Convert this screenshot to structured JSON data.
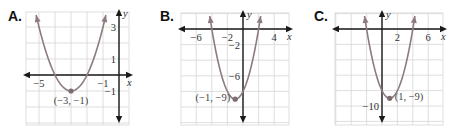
{
  "chart_data": [
    {
      "type": "line",
      "panel": "A.",
      "title": "A.",
      "function": "y = (x + 3)^2 - 1",
      "xlabel": "x",
      "ylabel": "y",
      "x_tick_labels": [
        {
          "value": -5,
          "text": "−5"
        },
        {
          "value": -1,
          "text": "−1"
        }
      ],
      "y_tick_labels": [
        {
          "value": 3,
          "text": "3"
        },
        {
          "value": 1,
          "text": "1"
        },
        {
          "value": -1,
          "text": "−1"
        }
      ],
      "vertex": {
        "x": -3,
        "y": -1,
        "label": "(−3, −1)"
      },
      "x_intercepts": [
        -4,
        -2
      ],
      "xlim": [
        -5.8,
        0.6
      ],
      "ylim": [
        -3.1,
        3.9
      ],
      "grid": true,
      "grid_step": 1,
      "layout": {
        "origin_px": [
          119,
          75
        ],
        "px_per_unit": 16,
        "grid_px": [
          26,
          12,
          129,
          125
        ],
        "letter_px": [
          8,
          21
        ]
      }
    },
    {
      "type": "line",
      "panel": "B.",
      "title": "B.",
      "function": "y = (x + 1)^2 - 9",
      "xlabel": "x",
      "ylabel": "y",
      "x_tick_labels": [
        {
          "value": -6,
          "text": "−6"
        },
        {
          "value": -2,
          "text": "−2"
        },
        {
          "value": 4,
          "text": "4"
        }
      ],
      "y_tick_labels": [
        {
          "value": -2,
          "text": "−2"
        },
        {
          "value": -6,
          "text": "−6"
        }
      ],
      "vertex": {
        "x": -1,
        "y": -9,
        "label": "(−1, −9)"
      },
      "x_intercepts": [
        -4,
        2
      ],
      "xlim": [
        -8,
        6
      ],
      "ylim": [
        -12,
        2
      ],
      "grid": true,
      "grid_step": 2,
      "layout": {
        "origin_px": [
          243,
          29
        ],
        "px_per_unit": 7.8,
        "grid_px": [
          181,
          13,
          289,
          125
        ],
        "letter_px": [
          160,
          21
        ]
      }
    },
    {
      "type": "line",
      "panel": "C.",
      "title": "C.",
      "function": "y = (x - 1)^2 - 9",
      "xlabel": "x",
      "ylabel": "y",
      "x_tick_labels": [
        {
          "value": 2,
          "text": "2"
        },
        {
          "value": 6,
          "text": "6"
        }
      ],
      "y_tick_labels": [
        {
          "value": -10,
          "text": "−10"
        }
      ],
      "vertex": {
        "x": 1,
        "y": -9,
        "label": "(1, −9)"
      },
      "x_intercepts": [
        -2,
        4
      ],
      "xlim": [
        -6,
        8
      ],
      "ylim": [
        -12,
        2
      ],
      "grid": true,
      "grid_step": 2,
      "layout": {
        "origin_px": [
          382,
          29
        ],
        "px_per_unit": 7.7,
        "grid_px": [
          335,
          13,
          443,
          125
        ],
        "letter_px": [
          314,
          21
        ]
      }
    }
  ]
}
